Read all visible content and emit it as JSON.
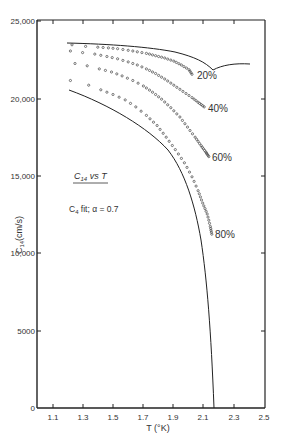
{
  "chart_data": {
    "type": "scatter",
    "title": "C14 vs T",
    "annotation": "C4 fit;  α = 0.7",
    "xlabel": "T (°K)",
    "ylabel": "C14 (cm/s)",
    "xlim": [
      1.0,
      2.5
    ],
    "ylim": [
      0,
      25000
    ],
    "x_ticks": [
      1.1,
      1.3,
      1.5,
      1.7,
      1.9,
      2.1,
      2.3,
      2.5
    ],
    "x_tick_labels": [
      "1.1",
      "1.3",
      "1.5",
      "1.7",
      "1.9",
      "2.1",
      "2.3",
      "2.5"
    ],
    "y_ticks": [
      0,
      5000,
      10000,
      15000,
      20000,
      25000
    ],
    "y_tick_labels": [
      "0",
      "5000",
      "10,000",
      "15,000",
      "20,000",
      "25,000"
    ],
    "grid": false,
    "legend_position": "inline labels at series ends",
    "series": [
      {
        "name": "20%",
        "style": "open-circles",
        "x": [
          1.23,
          1.32,
          1.4,
          1.47,
          1.53,
          1.6,
          1.66,
          1.72,
          1.78,
          1.84,
          1.9,
          1.95,
          2.0,
          2.02
        ],
        "y": [
          23400,
          23300,
          23250,
          23200,
          23150,
          23050,
          22950,
          22850,
          22700,
          22550,
          22350,
          22100,
          21800,
          21500
        ]
      },
      {
        "name": "40%",
        "style": "open-circles",
        "x": [
          1.22,
          1.3,
          1.38,
          1.46,
          1.53,
          1.6,
          1.66,
          1.72,
          1.78,
          1.84,
          1.9,
          1.96,
          2.02,
          2.06,
          2.1
        ],
        "y": [
          23000,
          22900,
          22800,
          22650,
          22500,
          22300,
          22100,
          21850,
          21550,
          21200,
          20800,
          20400,
          20000,
          19700,
          19400
        ]
      },
      {
        "name": "60%",
        "style": "open-circles",
        "x": [
          1.25,
          1.33,
          1.41,
          1.49,
          1.56,
          1.63,
          1.7,
          1.76,
          1.82,
          1.88,
          1.94,
          1.99,
          2.04,
          2.08,
          2.11,
          2.13
        ],
        "y": [
          22200,
          22050,
          21850,
          21650,
          21400,
          21100,
          20750,
          20350,
          19900,
          19350,
          18750,
          18100,
          17450,
          16900,
          16500,
          16200
        ]
      },
      {
        "name": "80%",
        "style": "open-circles",
        "x": [
          1.22,
          1.34,
          1.42,
          1.5,
          1.58,
          1.65,
          1.72,
          1.79,
          1.85,
          1.91,
          1.97,
          2.02,
          2.06,
          2.09,
          2.12,
          2.14,
          2.15
        ],
        "y": [
          21100,
          20800,
          20500,
          20200,
          19850,
          19400,
          18850,
          18200,
          17450,
          16650,
          15800,
          14900,
          14000,
          13200,
          12500,
          11700,
          11200
        ]
      },
      {
        "name": "upper-bound-curve",
        "style": "solid-line",
        "x": [
          1.2,
          1.4,
          1.6,
          1.8,
          1.95,
          2.05,
          2.12,
          2.2,
          2.3,
          2.4
        ],
        "y": [
          23600,
          23500,
          23350,
          23150,
          22900,
          22450,
          21800,
          22000,
          22150,
          22150
        ]
      },
      {
        "name": "lower-bound-curve",
        "style": "solid-line",
        "x": [
          1.2,
          1.35,
          1.5,
          1.65,
          1.8,
          1.9,
          2.0,
          2.08,
          2.13,
          2.16,
          2.17
        ],
        "y": [
          20500,
          19900,
          19100,
          17900,
          16000,
          14000,
          11000,
          7800,
          4500,
          2000,
          0
        ]
      }
    ],
    "series_labels": [
      "20%",
      "40%",
      "60%",
      "80%"
    ]
  },
  "labels": {
    "title": "C",
    "title_sub": "14",
    "title_rest": " vs T",
    "fit_c": "C",
    "fit_sub": "4",
    "fit_rest": " fit;  α = 0.7",
    "ylabel_c": "C",
    "ylabel_sub": "14",
    "ylabel_rest": "(cm/s)",
    "xlabel": "T (°K)",
    "s20": "20%",
    "s40": "40%",
    "s60": "60%",
    "s80": "80%"
  },
  "yticks": [
    "25,000",
    "20,000",
    "15,000",
    "10,000",
    "5000",
    "0"
  ],
  "xticks": [
    "1.1",
    "1.3",
    "1.5",
    "1.7",
    "1.9",
    "2.1",
    "2.3",
    "2.5"
  ]
}
